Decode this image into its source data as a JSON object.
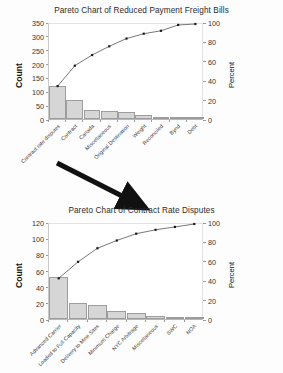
{
  "charts": [
    {
      "key": "top",
      "title": "Pareto Chart of Reduced Payment Freight Bills",
      "ylabel": "Count",
      "y2label": "Percent"
    },
    {
      "key": "bottom",
      "title": "Pareto Chart of Contract Rate Disputes",
      "ylabel": "Count",
      "y2label": "Percent"
    }
  ],
  "chart_data": [
    {
      "type": "bar",
      "title": "Pareto Chart of Reduced Payment Freight Bills",
      "xlabel": "",
      "ylabel": "Count",
      "y2label": "Percent",
      "ylim": [
        0,
        350
      ],
      "yticks": [
        0,
        50,
        100,
        150,
        200,
        250,
        300,
        350
      ],
      "y2lim": [
        0,
        100
      ],
      "y2ticks": [
        0,
        20,
        40,
        60,
        80,
        100
      ],
      "grid": false,
      "legend": "none",
      "categories": [
        "Contract rate disputes",
        "Contract",
        "Canada",
        "Miscellaneous",
        "Original Destination",
        "Weight",
        "Reconciled",
        "Bynd",
        "Debt"
      ],
      "values": [
        118,
        68,
        34,
        28,
        27,
        15,
        8,
        3,
        2
      ],
      "cumulative_percent": [
        36,
        57,
        68,
        77,
        85,
        90,
        93,
        99,
        100
      ]
    },
    {
      "type": "bar",
      "title": "Pareto Chart of Contract Rate Disputes",
      "xlabel": "",
      "ylabel": "Count",
      "y2label": "Percent",
      "ylim": [
        0,
        120
      ],
      "yticks": [
        0,
        20,
        40,
        60,
        80,
        100,
        120
      ],
      "y2lim": [
        0,
        100
      ],
      "y2ticks": [
        0,
        20,
        40,
        60,
        80,
        100
      ],
      "grid": false,
      "legend": "none",
      "categories": [
        "Advanced Carrier",
        "Loaded to Full Capacity",
        "Delivery to Mine Sites",
        "Minimum Charge",
        "NYC Arbitrage",
        "Miscellaneous",
        "SWC",
        "NOA"
      ],
      "values": [
        52,
        20,
        17,
        10,
        8,
        4,
        2,
        1
      ],
      "cumulative_percent": [
        44,
        61,
        75,
        83,
        90,
        94,
        97,
        100
      ]
    }
  ],
  "annotations": {
    "arrow": "drilldown-arrow"
  },
  "colors": {
    "bar_fill": "#d6d6d6",
    "bar_stroke": "#9d9d9d",
    "line": "#3c3c3c",
    "marker": "#1c1c1c",
    "text": "#2b2b2b",
    "arrow": "#111111"
  }
}
